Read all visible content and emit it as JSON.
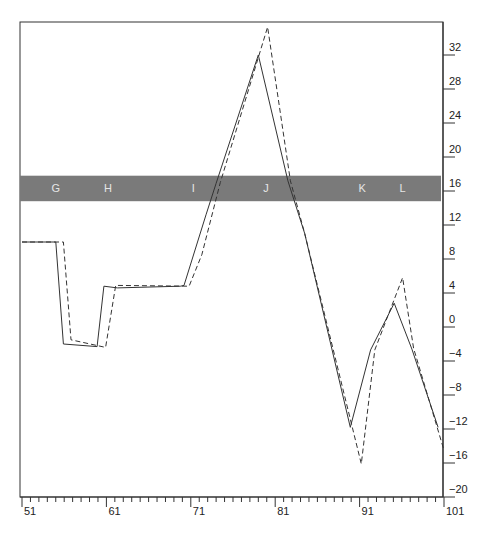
{
  "chart_data": {
    "type": "line",
    "title": "",
    "xlabel": "",
    "ylabel": "",
    "xlim": [
      51,
      101
    ],
    "ylim": [
      -20,
      34
    ],
    "x_ticks": [
      51,
      61,
      71,
      81,
      91,
      101
    ],
    "x_minor_tick_step": 1,
    "y_ticks": [
      32,
      28,
      24,
      20,
      16,
      12,
      8,
      4,
      0,
      -4,
      -8,
      -12,
      -16,
      -20
    ],
    "y_axis_position": "right",
    "grid": false,
    "legend": null,
    "band": {
      "y_from": 14.8,
      "y_to": 17.8,
      "color": "#7a7a7a",
      "labels": [
        {
          "text": "G",
          "x": 55
        },
        {
          "text": "H",
          "x": 61.2
        },
        {
          "text": "I",
          "x": 71.3
        },
        {
          "text": "J",
          "x": 79.9
        },
        {
          "text": "K",
          "x": 91.3
        },
        {
          "text": "L",
          "x": 96.1
        }
      ]
    },
    "series": [
      {
        "name": "solid",
        "style": "solid",
        "color": "#333333",
        "points": [
          [
            51,
            10
          ],
          [
            55,
            10
          ],
          [
            55.9,
            -2
          ],
          [
            59.9,
            -2.3
          ],
          [
            60.7,
            4.8
          ],
          [
            62.3,
            4.6
          ],
          [
            69.8,
            4.8
          ],
          [
            70.2,
            4.9
          ],
          [
            72.8,
            13.2
          ],
          [
            74,
            16.9
          ],
          [
            79,
            32
          ],
          [
            82.5,
            17.2
          ],
          [
            84.5,
            11
          ],
          [
            89.9,
            -11.8
          ],
          [
            92.3,
            -2.7
          ],
          [
            95.1,
            2.8
          ],
          [
            97.2,
            -2.6
          ],
          [
            100.3,
            -11.8
          ]
        ]
      },
      {
        "name": "dashed",
        "style": "dashed",
        "color": "#333333",
        "points": [
          [
            51,
            10
          ],
          [
            55.9,
            10
          ],
          [
            56.8,
            -1.5
          ],
          [
            60.9,
            -2.4
          ],
          [
            62.1,
            4.9
          ],
          [
            70.8,
            4.8
          ],
          [
            72.3,
            8.5
          ],
          [
            74.5,
            17
          ],
          [
            80.1,
            35.3
          ],
          [
            82.8,
            17.2
          ],
          [
            84.5,
            11
          ],
          [
            91.2,
            -16.1
          ],
          [
            92.8,
            -2.7
          ],
          [
            96.1,
            5.8
          ],
          [
            97.4,
            -2.5
          ],
          [
            101,
            -14.5
          ]
        ]
      }
    ]
  }
}
